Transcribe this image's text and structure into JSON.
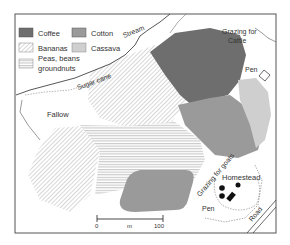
{
  "legend": {
    "items": [
      {
        "label": "Coffee",
        "swatch": "coffee"
      },
      {
        "label": "Cotton",
        "swatch": "cotton"
      },
      {
        "label": "Bananas",
        "swatch": "bananas"
      },
      {
        "label": "Cassava",
        "swatch": "cassava"
      },
      {
        "label": "Peas, beans",
        "swatch": "peas"
      },
      {
        "label": "groundnuts",
        "swatch": ""
      }
    ]
  },
  "labels": {
    "stream": "Stream",
    "sugar_cane": "Sugar cane",
    "fallow": "Fallow",
    "grazing_cattle_1": "Grazing for",
    "grazing_cattle_2": "Cattle",
    "pen_top": "Pen",
    "grazing_goats": "Grazing for goats",
    "homestead": "Homestead",
    "pen_bottom": "Pen",
    "road": "Road"
  },
  "scale_bar": {
    "start": "0",
    "unit": "m",
    "end": "100"
  },
  "colors": {
    "coffee": "#6e6e6e",
    "cotton": "#9a9a9a",
    "cassava": "#cfcfcf",
    "hatch": "#c4c4c4",
    "frame": "#555555",
    "line": "#444444"
  }
}
